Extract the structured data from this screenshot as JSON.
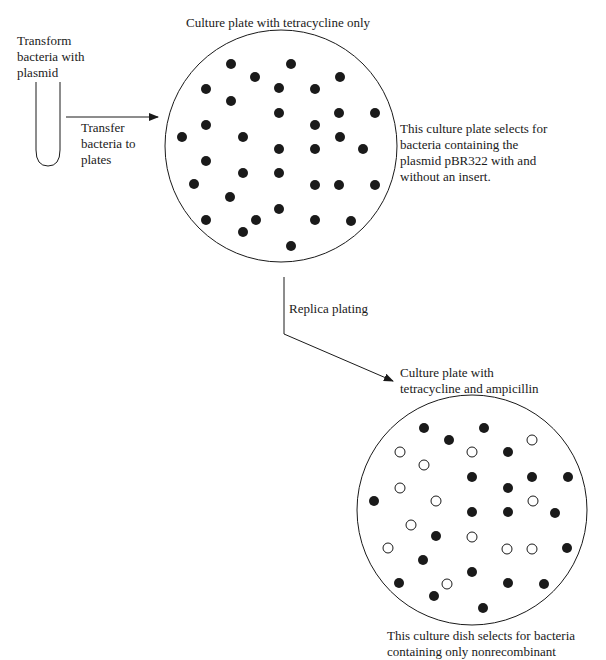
{
  "labels": {
    "transform": "Transform\nbacteria with\nplasmid",
    "transfer": "Transfer\nbacteria to\nplates",
    "plate1_title": "Culture plate with tetracycline only",
    "plate1_note": "This culture plate selects for\nbacteria containing the\nplasmid pBR322 with and\nwithout an insert.",
    "replica": "Replica plating",
    "plate2_title": "Culture plate with\ntetracycline and ampicillin",
    "plate2_note": "This culture dish selects for bacteria\ncontaining only nonrecombinant"
  },
  "colors": {
    "ink": "#1a1a1a",
    "background": "#ffffff"
  },
  "plate1": {
    "cx": 281,
    "cy": 146,
    "r": 116,
    "filled": [
      [
        231,
        64
      ],
      [
        291,
        64
      ],
      [
        255,
        77
      ],
      [
        340,
        77
      ],
      [
        206,
        89
      ],
      [
        279,
        88
      ],
      [
        315,
        89
      ],
      [
        231,
        101
      ],
      [
        279,
        113
      ],
      [
        339,
        113
      ],
      [
        375,
        113
      ],
      [
        206,
        125
      ],
      [
        315,
        125
      ],
      [
        182,
        137
      ],
      [
        243,
        137
      ],
      [
        340,
        137
      ],
      [
        279,
        149
      ],
      [
        315,
        149
      ],
      [
        363,
        149
      ],
      [
        206,
        161
      ],
      [
        243,
        173
      ],
      [
        279,
        173
      ],
      [
        194,
        184
      ],
      [
        315,
        185
      ],
      [
        339,
        185
      ],
      [
        375,
        185
      ],
      [
        230,
        197
      ],
      [
        279,
        209
      ],
      [
        206,
        220
      ],
      [
        256,
        220
      ],
      [
        315,
        220
      ],
      [
        351,
        221
      ],
      [
        243,
        232
      ],
      [
        291,
        246
      ]
    ]
  },
  "plate2": {
    "cx": 472,
    "cy": 510,
    "r": 115,
    "filled": [
      [
        424,
        428
      ],
      [
        484,
        428
      ],
      [
        449,
        440
      ],
      [
        508,
        452
      ],
      [
        472,
        477
      ],
      [
        532,
        477
      ],
      [
        568,
        477
      ],
      [
        508,
        488
      ],
      [
        374,
        501
      ],
      [
        472,
        512
      ],
      [
        508,
        512
      ],
      [
        555,
        513
      ],
      [
        436,
        536
      ],
      [
        567,
        548
      ],
      [
        423,
        560
      ],
      [
        472,
        572
      ],
      [
        399,
        583
      ],
      [
        508,
        583
      ],
      [
        544,
        584
      ],
      [
        434,
        596
      ],
      [
        483,
        608
      ]
    ],
    "open": [
      [
        532,
        440
      ],
      [
        400,
        452
      ],
      [
        472,
        452
      ],
      [
        424,
        465
      ],
      [
        400,
        488
      ],
      [
        436,
        501
      ],
      [
        533,
        501
      ],
      [
        411,
        525
      ],
      [
        472,
        537
      ],
      [
        388,
        548
      ],
      [
        507,
        549
      ],
      [
        532,
        549
      ],
      [
        447,
        584
      ]
    ]
  }
}
